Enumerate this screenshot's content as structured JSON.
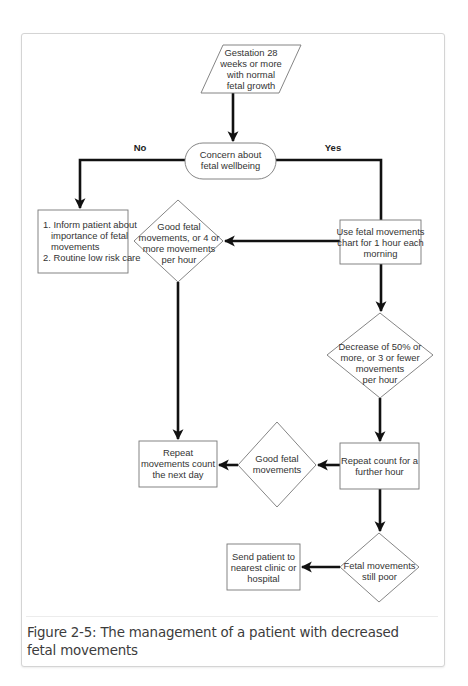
{
  "figure": {
    "caption": "Figure 2-5: The management of a patient with decreased fetal movements",
    "colors": {
      "line": "#111111",
      "shape_stroke": "#777777",
      "caption_text": "#3c3c3c",
      "card_border": "#d4d4d4"
    }
  },
  "flowchart": {
    "nodes": {
      "start": {
        "shape": "parallelogram",
        "lines": [
          "Gestation 28",
          "weeks or more",
          "with normal",
          "fetal growth"
        ]
      },
      "concern": {
        "shape": "terminal",
        "lines": [
          "Concern about",
          "fetal wellbeing"
        ]
      },
      "inform": {
        "shape": "rectangle",
        "lines": [
          "1. Inform patient about",
          "importance of fetal",
          "movements",
          "2. Routine low risk care"
        ]
      },
      "good_or_4": {
        "shape": "diamond",
        "lines": [
          "Good fetal",
          "movements, or 4 or",
          "more movements",
          "per hour"
        ]
      },
      "use_chart": {
        "shape": "rectangle",
        "lines": [
          "Use fetal movements",
          "chart for 1 hour each",
          "morning"
        ]
      },
      "decrease": {
        "shape": "diamond",
        "lines": [
          "Decrease of 50% or",
          "more, or 3 or fewer",
          "movements",
          "per hour"
        ]
      },
      "repeat_next_day": {
        "shape": "rectangle",
        "lines": [
          "Repeat",
          "movements count",
          "the next day"
        ]
      },
      "good_fetal": {
        "shape": "diamond",
        "lines": [
          "Good fetal",
          "movements"
        ]
      },
      "repeat_further": {
        "shape": "rectangle",
        "lines": [
          "Repeat count for a",
          "further hour"
        ]
      },
      "still_poor": {
        "shape": "diamond",
        "lines": [
          "Fetal movements",
          "still poor"
        ]
      },
      "send_patient": {
        "shape": "rectangle",
        "lines": [
          "Send patient to",
          "nearest clinic or",
          "hospital"
        ]
      }
    },
    "branch_labels": {
      "no": "No",
      "yes": "Yes"
    },
    "edges": [
      {
        "from": "start",
        "to": "concern"
      },
      {
        "from": "concern",
        "to": "inform",
        "label": "No"
      },
      {
        "from": "concern",
        "to": "use_chart",
        "label": "Yes"
      },
      {
        "from": "use_chart",
        "to": "good_or_4"
      },
      {
        "from": "use_chart",
        "to": "decrease"
      },
      {
        "from": "good_or_4",
        "to": "repeat_next_day"
      },
      {
        "from": "decrease",
        "to": "repeat_further"
      },
      {
        "from": "repeat_further",
        "to": "good_fetal"
      },
      {
        "from": "good_fetal",
        "to": "repeat_next_day"
      },
      {
        "from": "repeat_further",
        "to": "still_poor"
      },
      {
        "from": "still_poor",
        "to": "send_patient"
      }
    ]
  }
}
